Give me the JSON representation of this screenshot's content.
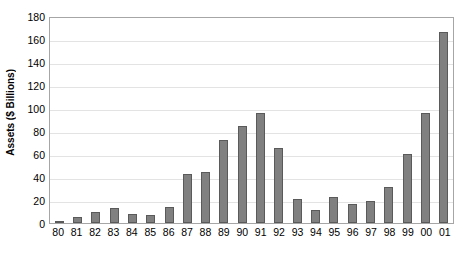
{
  "chart_data": {
    "type": "bar",
    "title": "",
    "xlabel": "",
    "ylabel": "Assets ($ Billions)",
    "categories": [
      "80",
      "81",
      "82",
      "83",
      "84",
      "85",
      "86",
      "87",
      "88",
      "89",
      "90",
      "91",
      "92",
      "93",
      "94",
      "95",
      "96",
      "97",
      "98",
      "99",
      "00",
      "01"
    ],
    "values": [
      1.5,
      5,
      9.5,
      13,
      7.5,
      7,
      14,
      42.5,
      44.5,
      72,
      84,
      96,
      65,
      21,
      11.5,
      23,
      16.5,
      19.5,
      31,
      60,
      96,
      166
    ],
    "ylim": [
      0,
      180
    ],
    "yticks": [
      0,
      20,
      40,
      60,
      80,
      100,
      120,
      140,
      160,
      180
    ],
    "ytick_labels": [
      "0",
      "20",
      "40",
      "60",
      "80",
      "100",
      "120",
      "140",
      "160",
      "180"
    ],
    "grid": true,
    "legend": "none",
    "bar_color": "#808080",
    "bar_edge_color": "#5a5a5a",
    "grid_color": "#e3e3e3",
    "axis_color": "#a6a6a6",
    "plot_background": "#ffffff"
  }
}
